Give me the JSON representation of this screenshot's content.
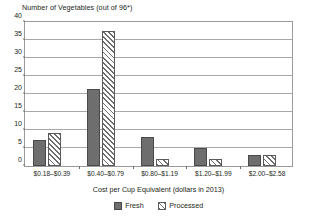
{
  "chart_data": {
    "type": "bar",
    "title": "",
    "ylabel": "Number of Vegetables (out of 96*)",
    "xlabel": "Cost per Cup Equivalent (dollars in 2013)",
    "categories": [
      "$0.18–$0.39",
      "$0.40–$0.79",
      "$0.80–$1.19",
      "$1.20–$1.99",
      "$2.00–$2.58"
    ],
    "series": [
      {
        "name": "Fresh",
        "values": [
          7,
          21,
          8,
          5,
          3
        ],
        "color": "#6e6e6e",
        "fill": "solid"
      },
      {
        "name": "Processed",
        "values": [
          9,
          37,
          2,
          2,
          3
        ],
        "color": "#6e6e6e",
        "fill": "diagonal-hatch"
      }
    ],
    "ylim": [
      0,
      40
    ],
    "ytick_values": [
      0,
      5,
      10,
      15,
      20,
      25,
      30,
      35,
      40
    ],
    "ytick_labels": [
      "0",
      "5",
      "10",
      "15",
      "20",
      "25",
      "30",
      "35",
      "40"
    ],
    "grid": "horizontal",
    "legend_position": "bottom-center",
    "legend_entries": [
      "Fresh",
      "Processed"
    ]
  }
}
